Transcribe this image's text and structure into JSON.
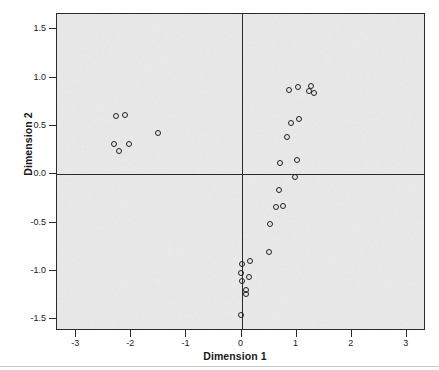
{
  "chart_data": {
    "type": "scatter",
    "title": "",
    "xlabel": "Dimension 1",
    "ylabel": "Dimension 2",
    "xlim": [
      -3.35,
      3.35
    ],
    "ylim": [
      -1.62,
      1.66
    ],
    "xticks": [
      -3,
      -2,
      -1,
      0,
      1,
      2,
      3
    ],
    "xtick_labels": [
      "-3",
      "-2",
      "-1",
      "0",
      "1",
      "2",
      "3"
    ],
    "yticks": [
      1.5,
      1.0,
      0.5,
      0.0,
      -0.5,
      -1.0,
      -1.5
    ],
    "ytick_labels": [
      "1.5",
      "1.0",
      "0.5",
      "0.0",
      "-0.5",
      "-1.0",
      "-1.5"
    ],
    "grid": false,
    "legend": null,
    "reference_lines": {
      "x": 0,
      "y": 0
    },
    "panel_background": "#e6e6e6",
    "marker": {
      "shape": "circle",
      "filled": false,
      "edge_color": "#1f1f1f",
      "size": 6
    },
    "points": [
      {
        "x": -2.28,
        "y": 0.6
      },
      {
        "x": -2.12,
        "y": 0.61
      },
      {
        "x": -1.52,
        "y": 0.43
      },
      {
        "x": -2.32,
        "y": 0.32
      },
      {
        "x": -2.05,
        "y": 0.31
      },
      {
        "x": -2.22,
        "y": 0.24
      },
      {
        "x": 0.86,
        "y": 0.87
      },
      {
        "x": 1.03,
        "y": 0.9
      },
      {
        "x": 1.27,
        "y": 0.91
      },
      {
        "x": 1.22,
        "y": 0.86
      },
      {
        "x": 1.31,
        "y": 0.84
      },
      {
        "x": 0.9,
        "y": 0.53
      },
      {
        "x": 1.04,
        "y": 0.57
      },
      {
        "x": 0.83,
        "y": 0.39
      },
      {
        "x": 0.7,
        "y": 0.12
      },
      {
        "x": 1.0,
        "y": 0.15
      },
      {
        "x": 0.98,
        "y": -0.03
      },
      {
        "x": 0.68,
        "y": -0.16
      },
      {
        "x": 0.63,
        "y": -0.34
      },
      {
        "x": 0.76,
        "y": -0.33
      },
      {
        "x": 0.52,
        "y": -0.51
      },
      {
        "x": 0.5,
        "y": -0.8
      },
      {
        "x": 0.15,
        "y": -0.9
      },
      {
        "x": 0.0,
        "y": -0.93
      },
      {
        "x": 0.13,
        "y": -1.06
      },
      {
        "x": -0.01,
        "y": -1.02
      },
      {
        "x": 0.0,
        "y": -1.1
      },
      {
        "x": 0.09,
        "y": -1.2
      },
      {
        "x": 0.09,
        "y": -1.24
      },
      {
        "x": -0.01,
        "y": -1.45
      }
    ]
  }
}
